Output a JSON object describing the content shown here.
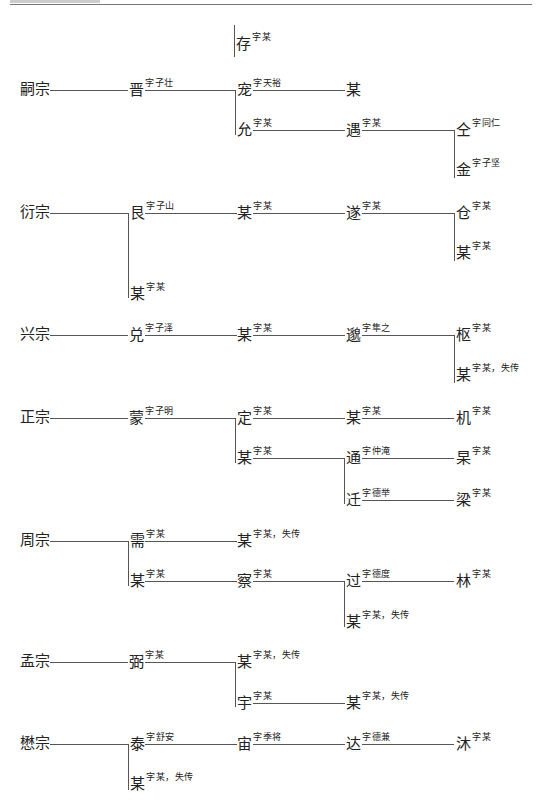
{
  "tree": {
    "cun": {
      "name": "存",
      "courtesy": "字某"
    },
    "sizong": {
      "root": "嗣宗",
      "jin": {
        "name": "晋",
        "courtesy": "字子壮"
      },
      "chong": {
        "name": "宠",
        "courtesy": "字天裕"
      },
      "chong_child": {
        "name": "某",
        "courtesy": ""
      },
      "yun": {
        "name": "允",
        "courtesy": "字某"
      },
      "yu": {
        "name": "遇",
        "courtesy": "字某"
      },
      "tong": {
        "name": "仝",
        "courtesy": "字同仁"
      },
      "jin2": {
        "name": "金",
        "courtesy": "字子坚"
      }
    },
    "yanzong": {
      "root": "衍宗",
      "gen": {
        "name": "艮",
        "courtesy": "字子山"
      },
      "mou1": {
        "name": "某",
        "courtesy": "字某"
      },
      "sui": {
        "name": "遂",
        "courtesy": "字某"
      },
      "cang": {
        "name": "仓",
        "courtesy": "字某"
      },
      "mou2": {
        "name": "某",
        "courtesy": "字某"
      },
      "mou3": {
        "name": "某",
        "courtesy": "字某"
      }
    },
    "xingzong": {
      "root": "兴宗",
      "dui": {
        "name": "兑",
        "courtesy": "字子泽"
      },
      "mou1": {
        "name": "某",
        "courtesy": "字某"
      },
      "miao": {
        "name": "邈",
        "courtesy": "字隼之"
      },
      "shu": {
        "name": "枢",
        "courtesy": "字某"
      },
      "mou2": {
        "name": "某",
        "courtesy": "字某，失传"
      }
    },
    "zhengzong": {
      "root": "正宗",
      "meng": {
        "name": "蒙",
        "courtesy": "字子明"
      },
      "ding": {
        "name": "定",
        "courtesy": "字某"
      },
      "mou1": {
        "name": "某",
        "courtesy": "字某"
      },
      "ji": {
        "name": "机",
        "courtesy": "字某"
      },
      "mou2": {
        "name": "某",
        "courtesy": "字某"
      },
      "tong": {
        "name": "通",
        "courtesy": "字仲淹"
      },
      "gao": {
        "name": "杲",
        "courtesy": "字某"
      },
      "qian": {
        "name": "迁",
        "courtesy": "字德举"
      },
      "liang": {
        "name": "梁",
        "courtesy": "字某"
      }
    },
    "zhouzong": {
      "root": "周宗",
      "xu": {
        "name": "需",
        "courtesy": "字某"
      },
      "mou1": {
        "name": "某",
        "courtesy": "字某，失传"
      },
      "mou2": {
        "name": "某",
        "courtesy": "字某"
      },
      "cha": {
        "name": "察",
        "courtesy": "字某"
      },
      "guo": {
        "name": "过",
        "courtesy": "字德度"
      },
      "lin": {
        "name": "林",
        "courtesy": "字某"
      },
      "mou3": {
        "name": "某",
        "courtesy": "字某，失传"
      }
    },
    "mengzong": {
      "root": "孟宗",
      "bi": {
        "name": "弼",
        "courtesy": "字某"
      },
      "mou1": {
        "name": "某",
        "courtesy": "字某，失传"
      },
      "yu": {
        "name": "宇",
        "courtesy": "字某"
      },
      "mou2": {
        "name": "某",
        "courtesy": "字某，失传"
      }
    },
    "maozong": {
      "root": "懋宗",
      "tai": {
        "name": "泰",
        "courtesy": "字舒安"
      },
      "zhou": {
        "name": "宙",
        "courtesy": "字季将"
      },
      "da": {
        "name": "达",
        "courtesy": "字德兼"
      },
      "mu": {
        "name": "沐",
        "courtesy": "字某"
      },
      "mou1": {
        "name": "某",
        "courtesy": "字某，失传"
      }
    }
  }
}
